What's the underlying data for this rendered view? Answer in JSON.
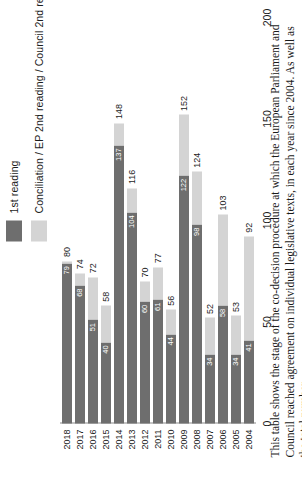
{
  "legend": {
    "items": [
      {
        "label": "1st reading",
        "color": "#6e6e6e",
        "swatch_name": "legend-swatch-first-reading"
      },
      {
        "label": "Conciliation / EP 2nd reading / Council 2nd reading",
        "color": "#d4d4d4",
        "swatch_name": "legend-swatch-conciliation"
      }
    ]
  },
  "caption": {
    "text": "This table shows the stage of the co-decision procedure at which the European Parliament and Council reached agreement on individual legislative texts, in each year since 2004. As well as the total number"
  },
  "chart_data": {
    "type": "bar",
    "title": "",
    "xlabel": "",
    "ylabel": "",
    "orientation": "horizontal-rotated",
    "stacked": true,
    "grid": false,
    "legend_position": "top-left",
    "axis_range": [
      0,
      200
    ],
    "axis_ticks": [
      "0",
      "50",
      "100",
      "150",
      "200"
    ],
    "categories": [
      "2004",
      "2005",
      "2006",
      "2007",
      "2008",
      "2009",
      "2010",
      "2011",
      "2012",
      "2013",
      "2014",
      "2015",
      "2016",
      "2017",
      "2018"
    ],
    "series": [
      {
        "name": "1st reading",
        "color": "#6e6e6e",
        "values": [
          41,
          34,
          58,
          34,
          98,
          122,
          44,
          61,
          60,
          104,
          137,
          40,
          51,
          68,
          79
        ]
      },
      {
        "name": "Conciliation / EP 2nd reading / Council 2nd reading",
        "color": "#d4d4d4",
        "values": [
          51,
          19,
          45,
          18,
          26,
          30,
          12,
          16,
          10,
          12,
          11,
          18,
          21,
          6,
          1
        ]
      }
    ],
    "totals": [
      92,
      53,
      103,
      52,
      124,
      152,
      56,
      77,
      70,
      116,
      148,
      58,
      72,
      74,
      80
    ]
  }
}
